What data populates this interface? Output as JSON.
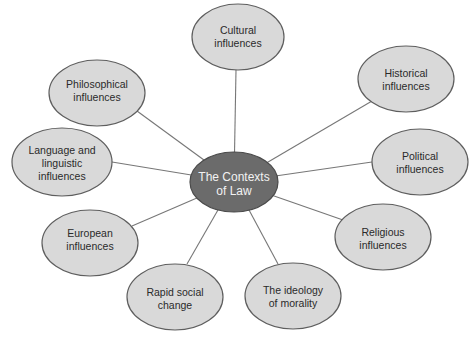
{
  "diagram": {
    "type": "mind-map",
    "colors": {
      "hub_fill": "#6b6b6b",
      "node_fill": "#d9d9d9",
      "outline": "#5e5e5e",
      "connector": "#777777",
      "hub_text": "#f2f2f2",
      "node_text": "#2a2a2a"
    },
    "hub": {
      "line1": "The Contexts",
      "line2": "of Law"
    },
    "nodes": [
      {
        "id": "cultural",
        "line1": "Cultural",
        "line2": "influences"
      },
      {
        "id": "historical",
        "line1": "Historical",
        "line2": "influences"
      },
      {
        "id": "political",
        "line1": "Political",
        "line2": "influences"
      },
      {
        "id": "religious",
        "line1": "Religious",
        "line2": "influences"
      },
      {
        "id": "ideology",
        "line1": "The ideology",
        "line2": "of morality"
      },
      {
        "id": "rapid-social",
        "line1": "Rapid social",
        "line2": "change"
      },
      {
        "id": "european",
        "line1": "European",
        "line2": "influences"
      },
      {
        "id": "language",
        "line1": "Language and",
        "line2": "linguistic",
        "line3": "influences"
      },
      {
        "id": "philosophical",
        "line1": "Philosophical",
        "line2": "influences"
      }
    ]
  }
}
